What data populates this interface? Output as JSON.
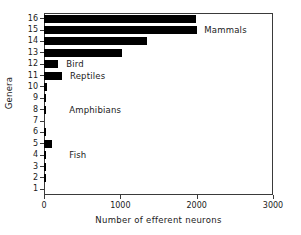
{
  "chart_data": {
    "type": "bar",
    "orientation": "horizontal",
    "title": "",
    "xlabel": "Number of efferent neurons",
    "ylabel": "Genera",
    "xlim": [
      0,
      3000
    ],
    "xticks": [
      "0",
      "1000",
      "2000",
      "3000"
    ],
    "grid": false,
    "legend": null,
    "categories": [
      "1",
      "2",
      "3",
      "4",
      "5",
      "6",
      "7",
      "8",
      "9",
      "10",
      "11",
      "12",
      "13",
      "14",
      "15",
      "16"
    ],
    "values": [
      0,
      20,
      15,
      30,
      105,
      20,
      0,
      10,
      25,
      45,
      235,
      185,
      1020,
      1350,
      2010,
      1995
    ],
    "series": [
      {
        "name": "efferent neurons",
        "values": [
          0,
          20,
          15,
          30,
          105,
          20,
          0,
          10,
          25,
          45,
          235,
          185,
          1020,
          1350,
          2010,
          1995
        ]
      }
    ],
    "annotations": [
      {
        "text": "Mammals",
        "x": 2100,
        "category": "15"
      },
      {
        "text": "Bird",
        "x": 290,
        "category": "12"
      },
      {
        "text": "Reptiles",
        "x": 340,
        "category": "11"
      },
      {
        "text": "Amphibians",
        "x": 330,
        "category": "8"
      },
      {
        "text": "Fish",
        "x": 330,
        "category": "4"
      }
    ],
    "bar_color": "#000000",
    "axis_color": "#3a3a3a",
    "background": "#ffffff"
  }
}
